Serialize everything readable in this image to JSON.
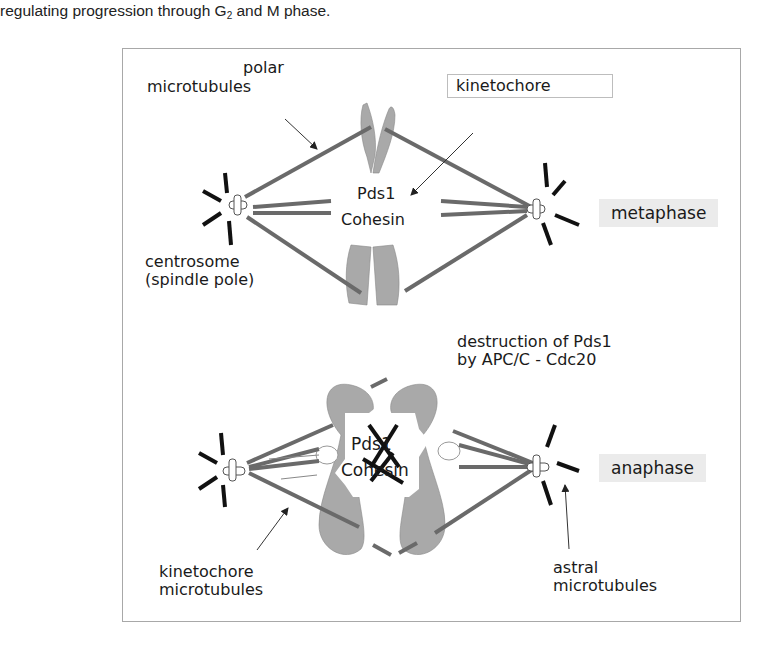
{
  "caption": {
    "before": "regulating progression through G",
    "subscript": "2",
    "after": " and M phase."
  },
  "figure": {
    "metaphase": {
      "phase_label": "metaphase",
      "labels": {
        "polar_mt_line1": "polar",
        "polar_mt_line2": "microtubules",
        "kinetochore": "kinetochore",
        "pds1": "Pds1",
        "cohesin": "Cohesin",
        "centrosome_line1": "centrosome",
        "centrosome_line2": "(spindle pole)"
      }
    },
    "transition": {
      "line1": "destruction of Pds1",
      "line2": "by APC/C - Cdc20"
    },
    "anaphase": {
      "phase_label": "anaphase",
      "labels": {
        "pds1": "Pds1",
        "cohesin": "Cohesin",
        "kinetochore_mt_line1": "kinetochore",
        "kinetochore_mt_line2": "microtubules",
        "astral_mt_line1": "astral",
        "astral_mt_line2": "microtubules"
      }
    },
    "colors": {
      "microtubule": "#6a6a6a",
      "chromosome": "#a9a9a9",
      "aster": "#111111",
      "phase_bg": "#ebebeb"
    }
  }
}
